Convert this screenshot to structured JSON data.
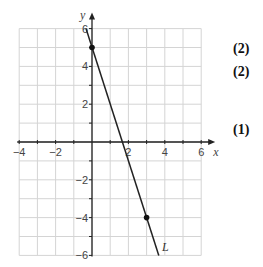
{
  "chart_data": {
    "type": "line",
    "title": "",
    "xlabel": "x",
    "ylabel": "y",
    "xlim": [
      -4,
      6
    ],
    "ylim": [
      -6,
      6
    ],
    "grid": true,
    "x_ticks": [
      -4,
      -2,
      2,
      4,
      6
    ],
    "y_ticks": [
      6,
      4,
      2,
      -2,
      -4,
      -6
    ],
    "series": [
      {
        "name": "L",
        "equation": "y = -3x + 5",
        "x": [
          -0.33,
          3.67
        ],
        "y": [
          6,
          -6
        ],
        "points": [
          {
            "x": 0,
            "y": 5
          },
          {
            "x": 3,
            "y": -4
          }
        ]
      }
    ],
    "line_label": "L"
  },
  "marks": [
    "(2)",
    "(2)",
    "(1)"
  ]
}
